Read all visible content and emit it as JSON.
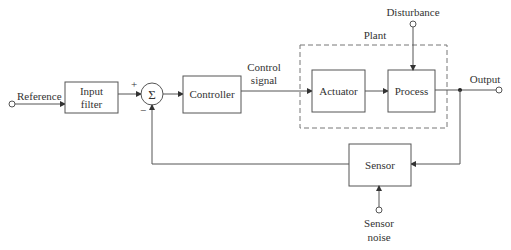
{
  "diagram": {
    "colors": {
      "stroke": "#555555",
      "text": "#333333",
      "background": "#ffffff"
    },
    "terminals": {
      "reference": "Reference",
      "output": "Output",
      "disturbance": "Disturbance",
      "sensor_noise_line1": "Sensor",
      "sensor_noise_line2": "noise"
    },
    "blocks": {
      "input_filter_line1": "Input",
      "input_filter_line2": "filter",
      "controller": "Controller",
      "actuator": "Actuator",
      "process": "Process",
      "sensor": "Sensor"
    },
    "summing_junction": {
      "symbol": "Σ",
      "plus_sign": "+",
      "minus_sign": "−"
    },
    "signals": {
      "control_signal_line1": "Control",
      "control_signal_line2": "signal"
    },
    "groups": {
      "plant": "Plant"
    }
  }
}
